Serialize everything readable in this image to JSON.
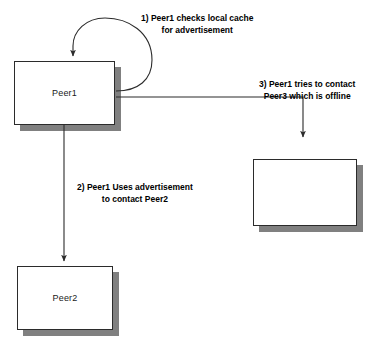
{
  "diagram": {
    "background_color": "#ffffff",
    "line_color": "#2b2b2b",
    "shadow_color": "#808080",
    "text_color": "#000000",
    "nodes": [
      {
        "id": "peer1",
        "label": "Peer1",
        "x": 14,
        "y": 61,
        "w": 101,
        "h": 64
      },
      {
        "id": "peer2",
        "label": "Peer2",
        "x": 17,
        "y": 266,
        "w": 96,
        "h": 64
      },
      {
        "id": "peer3",
        "label": "",
        "x": 253,
        "y": 159,
        "w": 104,
        "h": 67
      }
    ],
    "annotations": [
      {
        "id": "step1",
        "line1": "1) Peer1 checks local cache",
        "line2": "for advertisement",
        "x": 141,
        "y": 12
      },
      {
        "id": "step3",
        "line1": "3) Peer1 tries to contact",
        "line2": "Peer3 which is offline",
        "x": 259,
        "y": 78
      },
      {
        "id": "step2",
        "line1": "2) Peer1 Uses advertisement",
        "line2": "to contact Peer2",
        "x": 77,
        "y": 181
      }
    ],
    "edges": [
      {
        "id": "self-loop-peer1",
        "from": "peer1",
        "to": "peer1",
        "note": "1) Peer1 checks local cache for advertisement"
      },
      {
        "id": "peer1-to-peer2",
        "from": "peer1",
        "to": "peer2",
        "note": "2) Peer1 Uses advertisement to contact Peer2"
      },
      {
        "id": "peer1-to-peer3",
        "from": "peer1",
        "to": "peer3",
        "note": "3) Peer1 tries to contact Peer3 which is offline"
      }
    ]
  }
}
